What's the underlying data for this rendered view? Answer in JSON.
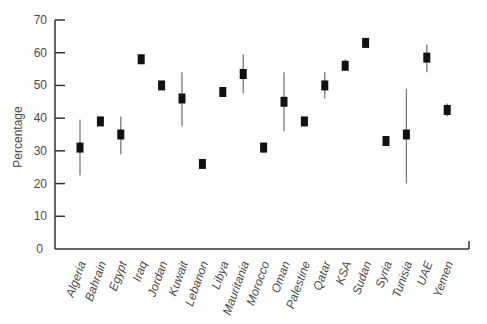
{
  "chart_data": {
    "type": "scatter",
    "subtype": "point-with-error-bars",
    "title": "",
    "xlabel": "",
    "ylabel": "Percentage",
    "ylim": [
      0,
      70
    ],
    "yticks": [
      0,
      10,
      20,
      30,
      40,
      50,
      60,
      70
    ],
    "grid": false,
    "legend": null,
    "categories": [
      "Algeria",
      "Bahrain",
      "Egypt",
      "Iraq",
      "Jordan",
      "Kuwait",
      "Lebanon",
      "Libya",
      "Mauritania",
      "Morocco",
      "Oman",
      "Palestine",
      "Qatar",
      "KSA",
      "Sudan",
      "Syria",
      "Tunisia",
      "UAE",
      "Yemen"
    ],
    "values": [
      31,
      39,
      35,
      58,
      50,
      46,
      26,
      48,
      53.5,
      31,
      45,
      39,
      50,
      56,
      63,
      33,
      35,
      58.5,
      42.5
    ],
    "error_low": [
      22.5,
      38,
      29,
      57,
      49,
      37.5,
      25,
      47,
      47.5,
      29.5,
      36,
      38,
      46,
      55,
      62,
      32,
      20,
      54,
      40.5
    ],
    "error_high": [
      39.5,
      40,
      40.5,
      59,
      51,
      54,
      27,
      49,
      59.5,
      32,
      54,
      40,
      54,
      58,
      64,
      34,
      49,
      62.5,
      44.5
    ],
    "marker_color": "#111111",
    "errorbar_color": "#777777",
    "axis_color": "#333333"
  }
}
